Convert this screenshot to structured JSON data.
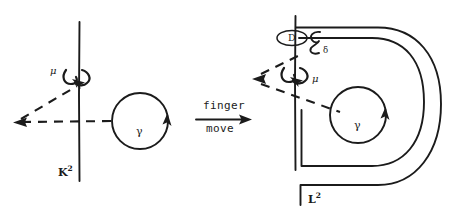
{
  "figure": {
    "background_color": "#ffffff",
    "ink_color": "#1b1b1b",
    "width": 454,
    "height": 219
  },
  "transition": {
    "label_top": "finger",
    "label_bottom": "move",
    "arrow_direction": "right"
  },
  "left_panel": {
    "name": "before-deformation",
    "surface_label": "K",
    "surface_exponent": "2",
    "axis_label": "μ",
    "loop_label": "γ",
    "rotation_arrow": "clockwise-around-axis",
    "loop_arrow": "counterclockwise"
  },
  "right_panel": {
    "name": "after-deformation",
    "surface_label": "L",
    "surface_exponent": "2",
    "axis_label": "μ",
    "loop_label": "γ",
    "disk_label": "D",
    "curve_label": "C",
    "curve_subscript": "δ",
    "rotation_arrow": "clockwise-around-axis",
    "loop_arrow": "counterclockwise"
  }
}
